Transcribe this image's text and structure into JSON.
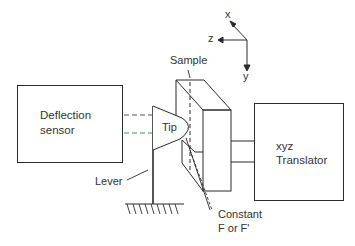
{
  "diagram": {
    "type": "schematic",
    "title": "",
    "components": {
      "deflection_sensor": {
        "line1": "Deflection",
        "line2": "sensor"
      },
      "translator": {
        "line1": "xyz",
        "line2": "Translator"
      },
      "tip": {
        "label": "Tip"
      },
      "sample": {
        "label": "Sample"
      },
      "lever": {
        "label": "Lever"
      },
      "constant": {
        "line1": "Constant",
        "line2": "F or F'"
      }
    },
    "axes": {
      "x": "x",
      "y": "y",
      "z": "z"
    },
    "colors": {
      "line": "#2a2a2a",
      "dashed_upper": "#555555",
      "dashed_lower": "#3a9a4a"
    }
  }
}
